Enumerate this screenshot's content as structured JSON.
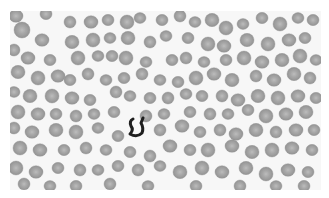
{
  "image": {
    "description": "Grayscale peripheral blood smear micrograph showing densely packed red blood cells with one dark curved inclusion near center-left",
    "frame": {
      "x": 10,
      "y": 11,
      "width": 311,
      "height": 179
    },
    "background_color": "#f7f7f7",
    "margin_color": "#ffffff",
    "cell_fill": "#9a9a9a",
    "cell_edge": "#8a8a8a",
    "cell_center": "#b8b8b8",
    "dark_object_color": "#1e1e1e",
    "dark_object": {
      "label": "dark curved inclusion",
      "cx": 137,
      "cy": 127
    },
    "cells": [
      [
        16,
        16,
        7
      ],
      [
        46,
        14,
        6
      ],
      [
        70,
        22,
        6
      ],
      [
        91,
        22,
        7
      ],
      [
        108,
        20,
        6
      ],
      [
        127,
        22,
        7
      ],
      [
        140,
        18,
        6
      ],
      [
        162,
        20,
        6
      ],
      [
        180,
        16,
        6
      ],
      [
        195,
        22,
        6
      ],
      [
        212,
        20,
        7
      ],
      [
        226,
        28,
        7
      ],
      [
        243,
        24,
        6
      ],
      [
        262,
        18,
        6
      ],
      [
        280,
        24,
        7
      ],
      [
        298,
        18,
        6
      ],
      [
        313,
        20,
        6
      ],
      [
        22,
        30,
        8
      ],
      [
        42,
        40,
        7
      ],
      [
        72,
        42,
        7
      ],
      [
        93,
        40,
        7
      ],
      [
        110,
        38,
        6
      ],
      [
        128,
        38,
        7
      ],
      [
        150,
        42,
        6
      ],
      [
        166,
        36,
        6
      ],
      [
        188,
        38,
        6
      ],
      [
        208,
        44,
        7
      ],
      [
        224,
        46,
        7
      ],
      [
        247,
        40,
        7
      ],
      [
        268,
        44,
        7
      ],
      [
        289,
        40,
        7
      ],
      [
        305,
        38,
        6
      ],
      [
        14,
        50,
        6
      ],
      [
        28,
        58,
        7
      ],
      [
        50,
        60,
        6
      ],
      [
        78,
        58,
        7
      ],
      [
        98,
        56,
        6
      ],
      [
        112,
        56,
        6
      ],
      [
        126,
        58,
        7
      ],
      [
        146,
        62,
        6
      ],
      [
        172,
        60,
        6
      ],
      [
        186,
        58,
        6
      ],
      [
        204,
        62,
        6
      ],
      [
        226,
        60,
        6
      ],
      [
        244,
        58,
        7
      ],
      [
        262,
        62,
        7
      ],
      [
        282,
        60,
        7
      ],
      [
        300,
        56,
        7
      ],
      [
        316,
        60,
        6
      ],
      [
        18,
        72,
        7
      ],
      [
        38,
        78,
        7
      ],
      [
        58,
        76,
        7
      ],
      [
        70,
        80,
        6
      ],
      [
        88,
        74,
        6
      ],
      [
        106,
        80,
        6
      ],
      [
        124,
        78,
        6
      ],
      [
        142,
        74,
        6
      ],
      [
        160,
        80,
        6
      ],
      [
        178,
        82,
        6
      ],
      [
        196,
        78,
        7
      ],
      [
        214,
        74,
        7
      ],
      [
        232,
        80,
        7
      ],
      [
        256,
        76,
        6
      ],
      [
        274,
        80,
        7
      ],
      [
        294,
        74,
        7
      ],
      [
        310,
        78,
        6
      ],
      [
        14,
        92,
        6
      ],
      [
        30,
        96,
        7
      ],
      [
        52,
        96,
        7
      ],
      [
        72,
        98,
        7
      ],
      [
        90,
        100,
        6
      ],
      [
        116,
        92,
        6
      ],
      [
        130,
        96,
        6
      ],
      [
        150,
        98,
        6
      ],
      [
        168,
        98,
        6
      ],
      [
        186,
        94,
        6
      ],
      [
        202,
        96,
        6
      ],
      [
        222,
        96,
        6
      ],
      [
        238,
        100,
        7
      ],
      [
        258,
        96,
        7
      ],
      [
        278,
        98,
        7
      ],
      [
        298,
        96,
        7
      ],
      [
        316,
        98,
        6
      ],
      [
        18,
        112,
        7
      ],
      [
        38,
        114,
        7
      ],
      [
        56,
        114,
        6
      ],
      [
        76,
        116,
        6
      ],
      [
        94,
        114,
        6
      ],
      [
        114,
        112,
        6
      ],
      [
        146,
        116,
        6
      ],
      [
        164,
        114,
        6
      ],
      [
        190,
        112,
        6
      ],
      [
        210,
        114,
        6
      ],
      [
        228,
        114,
        6
      ],
      [
        248,
        110,
        6
      ],
      [
        266,
        116,
        7
      ],
      [
        286,
        114,
        7
      ],
      [
        306,
        112,
        7
      ],
      [
        14,
        128,
        6
      ],
      [
        32,
        132,
        7
      ],
      [
        56,
        130,
        7
      ],
      [
        76,
        132,
        7
      ],
      [
        98,
        128,
        6
      ],
      [
        118,
        136,
        6
      ],
      [
        160,
        130,
        6
      ],
      [
        182,
        126,
        7
      ],
      [
        200,
        132,
        6
      ],
      [
        220,
        130,
        6
      ],
      [
        236,
        134,
        7
      ],
      [
        256,
        130,
        7
      ],
      [
        276,
        132,
        6
      ],
      [
        296,
        130,
        7
      ],
      [
        314,
        130,
        6
      ],
      [
        20,
        148,
        7
      ],
      [
        40,
        150,
        7
      ],
      [
        64,
        150,
        6
      ],
      [
        86,
        148,
        6
      ],
      [
        106,
        150,
        6
      ],
      [
        130,
        152,
        6
      ],
      [
        150,
        156,
        6
      ],
      [
        170,
        146,
        7
      ],
      [
        190,
        150,
        6
      ],
      [
        208,
        150,
        7
      ],
      [
        232,
        146,
        7
      ],
      [
        252,
        152,
        7
      ],
      [
        272,
        150,
        7
      ],
      [
        292,
        148,
        7
      ],
      [
        312,
        150,
        6
      ],
      [
        16,
        168,
        7
      ],
      [
        36,
        172,
        7
      ],
      [
        58,
        168,
        6
      ],
      [
        80,
        170,
        6
      ],
      [
        98,
        170,
        6
      ],
      [
        118,
        166,
        6
      ],
      [
        138,
        170,
        6
      ],
      [
        160,
        166,
        6
      ],
      [
        180,
        172,
        7
      ],
      [
        202,
        168,
        7
      ],
      [
        222,
        172,
        7
      ],
      [
        246,
        168,
        7
      ],
      [
        266,
        174,
        7
      ],
      [
        288,
        170,
        7
      ],
      [
        308,
        172,
        6
      ],
      [
        24,
        184,
        6
      ],
      [
        50,
        186,
        6
      ],
      [
        76,
        186,
        6
      ],
      [
        110,
        184,
        6
      ],
      [
        148,
        186,
        6
      ],
      [
        196,
        186,
        6
      ],
      [
        240,
        186,
        6
      ],
      [
        276,
        186,
        6
      ],
      [
        304,
        186,
        6
      ]
    ]
  }
}
